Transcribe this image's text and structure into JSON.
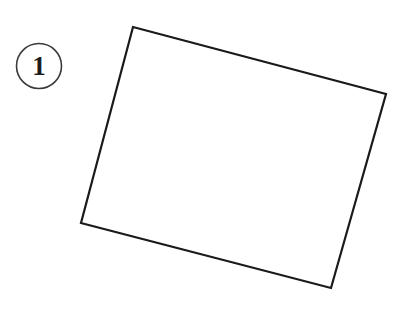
{
  "figure": {
    "background_color": "#ffffff",
    "stroke_color": "#1a1a1a",
    "label": {
      "text": "1",
      "shape": "circle",
      "circle_stroke_color": "#3a3a3a",
      "circle_center_x": 39,
      "circle_center_y": 66,
      "circle_radius": 22.5,
      "circle_stroke_width": 1.6,
      "font_size_px": 27
    },
    "shape": {
      "name": "quadrilateral",
      "type": "rotated-rectangle",
      "stroke_width": 2.2,
      "fill": "none",
      "rotation_degrees": 14.9,
      "vertices": [
        {
          "name": "top-left",
          "x": 133,
          "y": 27
        },
        {
          "name": "top-right",
          "x": 386,
          "y": 94
        },
        {
          "name": "bottom-right",
          "x": 331,
          "y": 288
        },
        {
          "name": "bottom-left",
          "x": 81,
          "y": 223
        }
      ],
      "path": "M 133 27 L 386 94 L 331 288 L 81 223 Z"
    }
  }
}
